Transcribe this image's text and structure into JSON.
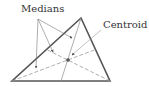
{
  "labels": {
    "medians": "Medians",
    "centroid": "Centroid"
  },
  "triangle": {
    "vertices": [
      [
        81,
        18
      ],
      [
        12,
        81
      ],
      [
        110,
        81
      ]
    ],
    "stroke": "#555555"
  },
  "centroid_point": [
    68,
    60
  ],
  "colors": {
    "triangle": "#555555",
    "median": "#9a9a9a",
    "pointer": "#777777",
    "centroid": "#555555"
  }
}
